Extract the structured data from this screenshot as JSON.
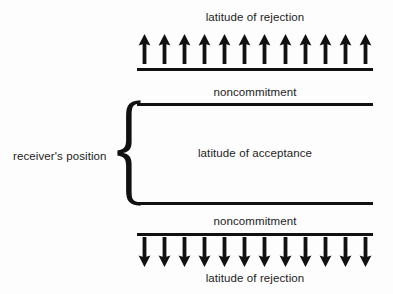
{
  "diagram": {
    "background_color": "#fdfdfd",
    "ink_color": "#111111"
  },
  "labels": {
    "top_rejection": "latitude of rejection",
    "top_noncommitment": "noncommitment",
    "acceptance": "latitude of acceptance",
    "bottom_noncommitment": "noncommitment",
    "bottom_rejection": "latitude of rejection",
    "receiver_position": "receiver's position"
  },
  "arrows": {
    "top_direction": "up",
    "top_count": 12,
    "bottom_direction": "down",
    "bottom_count": 12
  },
  "rules": {
    "count": 4,
    "labels": [
      "top-rejection-boundary",
      "acceptance-upper-boundary",
      "acceptance-lower-boundary",
      "bottom-rejection-boundary"
    ]
  },
  "brace": {
    "orientation": "left-pointing",
    "spans": "latitude of acceptance"
  }
}
